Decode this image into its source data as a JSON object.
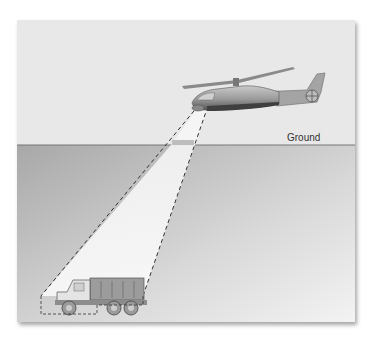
{
  "diagram": {
    "title": "",
    "labels": {
      "ground": "Ground"
    },
    "elements": [
      {
        "name": "helicopter",
        "role": "sensor platform in air"
      },
      {
        "name": "sensor-beam",
        "role": "dashed field-of-view cone"
      },
      {
        "name": "ground-line",
        "role": "boundary between air and ground"
      },
      {
        "name": "dump-truck",
        "role": "target on ground"
      }
    ],
    "colors": {
      "sky": "#e9e9e9",
      "ground_top": "#a9a9a9",
      "ground_bottom": "#f2f2f2",
      "beam": "#f6f6f6",
      "line": "#333333"
    }
  }
}
